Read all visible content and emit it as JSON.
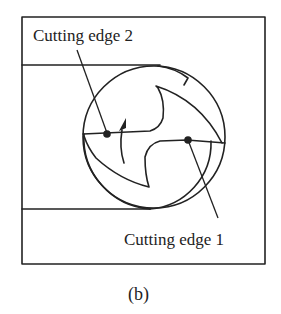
{
  "figure": {
    "caption": "(b)",
    "labels": {
      "cutting_edge_2": "Cutting edge 2",
      "cutting_edge_1": "Cutting edge 1"
    },
    "colors": {
      "stroke": "#222222",
      "background": "#ffffff"
    },
    "elements": [
      "outer-frame",
      "top-workpiece-strip",
      "bottom-workpiece-strip",
      "tool-circle",
      "two-flute-cutter-profile",
      "rotation-arrow",
      "cutting-edge-2-point",
      "cutting-edge-1-point",
      "leader-lines"
    ]
  }
}
